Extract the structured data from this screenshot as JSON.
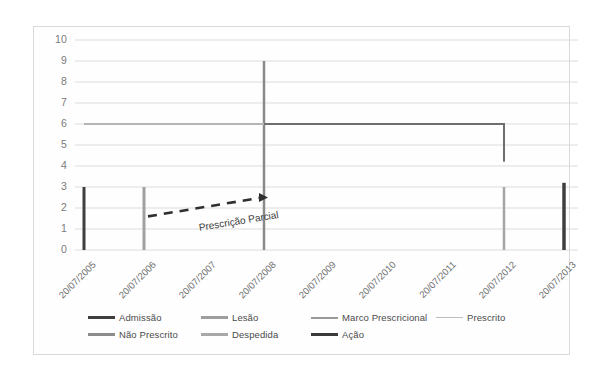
{
  "chart_data": {
    "type": "line",
    "title": "",
    "xlabel": "",
    "ylabel": "",
    "ylim": [
      0,
      10
    ],
    "yticks": [
      0,
      1,
      2,
      3,
      4,
      5,
      6,
      7,
      8,
      9,
      10
    ],
    "grid": true,
    "legend_position": "bottom",
    "categories": [
      "20/07/2005",
      "20/07/2006",
      "20/07/2007",
      "20/07/2008",
      "20/07/2009",
      "20/07/2010",
      "20/07/2011",
      "20/07/2012",
      "20/07/2013"
    ],
    "annotations": [
      {
        "text": "Prescrição Parcial",
        "x_start": "20/07/2006",
        "y_start": 1.6,
        "x_end": "20/07/2008",
        "y_end": 2.5,
        "style": "dashed-arrow"
      }
    ],
    "series": [
      {
        "name": "Admissão",
        "type": "vertical-marker",
        "color": "#3f3f3f",
        "width": 3,
        "points": [
          {
            "x": "20/07/2005",
            "y0": 0,
            "y1": 3
          }
        ]
      },
      {
        "name": "Lesão",
        "type": "vertical-marker",
        "color": "#a0a0a0",
        "width": 3,
        "points": [
          {
            "x": "20/07/2006",
            "y0": 0,
            "y1": 3
          }
        ]
      },
      {
        "name": "Marco Prescricional",
        "type": "vertical-marker",
        "color": "#8a8a8a",
        "width": 2.5,
        "points": [
          {
            "x": "20/07/2008",
            "y0": 0,
            "y1": 9
          }
        ]
      },
      {
        "name": "Prescrito",
        "type": "step-line",
        "color": "#b5b5b5",
        "width": 2,
        "points": [
          {
            "x": "20/07/2005",
            "y": 6
          },
          {
            "x": "20/07/2008",
            "y": 6
          }
        ]
      },
      {
        "name": "Não Prescrito",
        "type": "step-line",
        "color": "#6e6e6e",
        "width": 2,
        "points": [
          {
            "x": "20/07/2008",
            "y": 6
          },
          {
            "x": "20/07/2012",
            "y": 6
          },
          {
            "x": "20/07/2012",
            "y": 4.2
          }
        ]
      },
      {
        "name": "Despedida",
        "type": "vertical-marker",
        "color": "#a5a5a5",
        "width": 2.5,
        "points": [
          {
            "x": "20/07/2012",
            "y0": 0,
            "y1": 3
          }
        ]
      },
      {
        "name": "Ação",
        "type": "vertical-marker",
        "color": "#3f3f3f",
        "width": 3.5,
        "points": [
          {
            "x": "20/07/2013",
            "y0": 0,
            "y1": 3.2
          }
        ]
      }
    ]
  },
  "axes": {
    "y_labels": [
      "10",
      "9",
      "8",
      "7",
      "6",
      "5",
      "4",
      "3",
      "2",
      "1",
      "0"
    ],
    "x_labels": [
      "20/07/2005",
      "20/07/2006",
      "20/07/2007",
      "20/07/2008",
      "20/07/2009",
      "20/07/2010",
      "20/07/2011",
      "20/07/2012",
      "20/07/2013"
    ]
  },
  "legend": {
    "rows": [
      [
        {
          "label": "Admissão",
          "color": "#3f3f3f",
          "thickness": 3
        },
        {
          "label": "Lesão",
          "color": "#9e9e9e",
          "thickness": 2.5
        },
        {
          "label": "Marco Prescricional",
          "color": "#9a9a9a",
          "thickness": 2
        },
        {
          "label": "Prescrito",
          "color": "#bdbdbd",
          "thickness": 1.6
        }
      ],
      [
        {
          "label": "Não Prescrito",
          "color": "#8c8c8c",
          "thickness": 2.4
        },
        {
          "label": "Despedida",
          "color": "#a8a8a8",
          "thickness": 2.2
        },
        {
          "label": "Ação",
          "color": "#3a3a3a",
          "thickness": 3.4
        }
      ]
    ]
  },
  "annotation": {
    "text": "Prescrição Parcial"
  }
}
